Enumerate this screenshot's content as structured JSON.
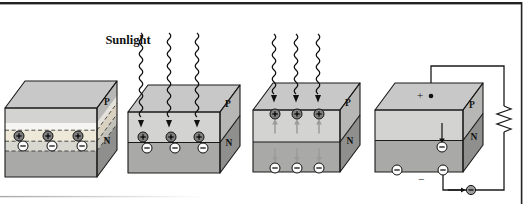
{
  "figure": {
    "sunlight_label": "Sunlight",
    "symbols": {
      "plus": "+",
      "minus": "−"
    },
    "panels": [
      {
        "p": "P",
        "n": "N"
      },
      {
        "p": "P",
        "n": "N"
      },
      {
        "p": "P",
        "n": "N"
      },
      {
        "p": "P",
        "n": "N",
        "pos_terminal": "+",
        "neg_terminal": "−"
      }
    ],
    "colors": {
      "top_face": "#c8c8c8",
      "front_p": "#d3d3d1",
      "front_n": "#a9a9a7",
      "side_p": "#b7b7b5",
      "side_n": "#8f8f8d",
      "band_white": "#f6f5f1",
      "band_plus": "#eee8d8",
      "band_minus": "#d8d7d0",
      "side_band_white": "#e3e1d9",
      "side_band_plus": "#d9d2c0",
      "side_band_minus": "#c2c1b9",
      "positive_fill": "#808080",
      "negative_fill": "#fcfcfc",
      "electron_fill": "#9c9c9c",
      "line": "#1a1a1a",
      "flow_arrow": "#9b9b9b"
    }
  }
}
